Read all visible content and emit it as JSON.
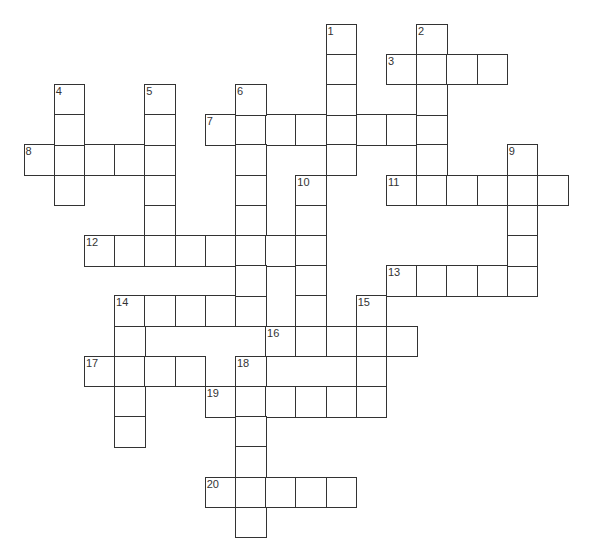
{
  "puzzle": {
    "cell_size": 30.2,
    "origin_x": 23.5,
    "origin_y": 23.5,
    "border_color": "#333333",
    "number_color": "#333333",
    "across": [
      {
        "number": "3",
        "row": 1,
        "col": 12,
        "length": 4
      },
      {
        "number": "7",
        "row": 3,
        "col": 6,
        "length": 8
      },
      {
        "number": "8",
        "row": 4,
        "col": 0,
        "length": 5
      },
      {
        "number": "11",
        "row": 5,
        "col": 12,
        "length": 6
      },
      {
        "number": "12",
        "row": 7,
        "col": 2,
        "length": 8
      },
      {
        "number": "13",
        "row": 8,
        "col": 12,
        "length": 5
      },
      {
        "number": "14",
        "row": 9,
        "col": 3,
        "length": 5
      },
      {
        "number": "16",
        "row": 10,
        "col": 8,
        "length": 5
      },
      {
        "number": "17",
        "row": 11,
        "col": 2,
        "length": 4
      },
      {
        "number": "19",
        "row": 12,
        "col": 6,
        "length": 6
      },
      {
        "number": "20",
        "row": 15,
        "col": 6,
        "length": 5
      }
    ],
    "down": [
      {
        "number": "1",
        "row": 0,
        "col": 10,
        "length": 5
      },
      {
        "number": "2",
        "row": 0,
        "col": 13,
        "length": 6
      },
      {
        "number": "4",
        "row": 2,
        "col": 1,
        "length": 4
      },
      {
        "number": "5",
        "row": 2,
        "col": 4,
        "length": 6
      },
      {
        "number": "6",
        "row": 2,
        "col": 7,
        "length": 8
      },
      {
        "number": "9",
        "row": 4,
        "col": 16,
        "length": 5
      },
      {
        "number": "10",
        "row": 5,
        "col": 9,
        "length": 6
      },
      {
        "number": "14",
        "row": 9,
        "col": 3,
        "length": 5
      },
      {
        "number": "15",
        "row": 9,
        "col": 11,
        "length": 4
      },
      {
        "number": "18",
        "row": 11,
        "col": 7,
        "length": 6
      }
    ]
  }
}
